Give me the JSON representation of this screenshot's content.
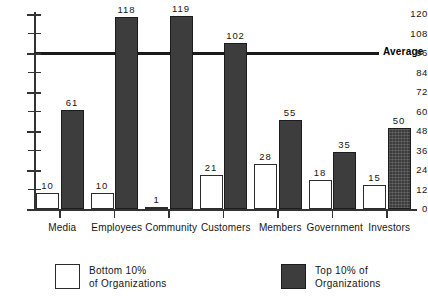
{
  "chart_data": {
    "type": "bar",
    "title": "",
    "xlabel": "",
    "ylabel": "",
    "ylim": [
      0,
      120
    ],
    "yticks": [
      0,
      12,
      24,
      36,
      48,
      60,
      72,
      84,
      96,
      108,
      120
    ],
    "grid": false,
    "legend_position": "bottom",
    "categories": [
      "Media",
      "Employees",
      "Community",
      "Customers",
      "Members",
      "Government",
      "Investors"
    ],
    "series": [
      {
        "name": "Bottom 10% of Organizations",
        "values": [
          10,
          10,
          1,
          21,
          28,
          18,
          15
        ]
      },
      {
        "name": "Top 10% of Organizations",
        "values": [
          61,
          118,
          119,
          102,
          55,
          35,
          50
        ]
      }
    ],
    "annotations": [
      {
        "label": "Average",
        "value": 96,
        "type": "horizontal-line"
      }
    ]
  },
  "axis": {
    "y_tick_labels": [
      "120",
      "108",
      "96",
      "84",
      "72",
      "60",
      "48",
      "36",
      "24",
      "12",
      "0"
    ]
  },
  "legend": {
    "items": [
      {
        "swatch": "low",
        "line1": "Bottom 10%",
        "line2": "of Organizations"
      },
      {
        "swatch": "high",
        "line1": "Top 10% of",
        "line2": "Organizations"
      }
    ]
  },
  "colors": {
    "bar_low": "#ffffff",
    "bar_high": "#3d3d3d",
    "axis": "#333333",
    "text": "#151515"
  }
}
